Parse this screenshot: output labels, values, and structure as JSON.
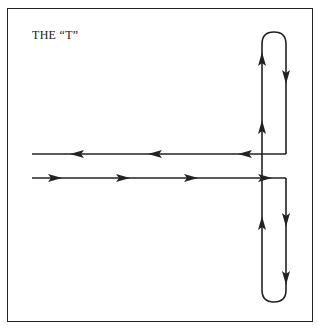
{
  "diagram": {
    "title": "THE “T”",
    "stroke_color": "#222222",
    "paths": [
      {
        "name": "upper-horizontal-return",
        "direction": "leftward"
      },
      {
        "name": "lower-horizontal-entry",
        "direction": "rightward"
      },
      {
        "name": "upper-loop",
        "direction": "up-left-side, down-right-side"
      },
      {
        "name": "lower-loop",
        "direction": "down-right-side, up-left-side"
      }
    ]
  }
}
